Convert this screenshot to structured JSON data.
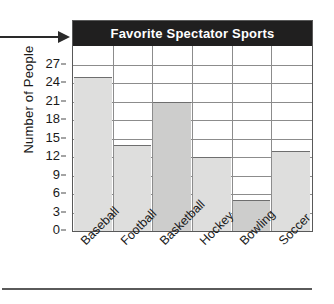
{
  "chart_data": {
    "type": "bar",
    "title": "Favorite Spectator Sports",
    "xlabel": "",
    "ylabel": "Number of People",
    "categories": [
      "Baseball",
      "Football",
      "Basketball",
      "Hockey",
      "Bowling",
      "Soccer"
    ],
    "values": [
      25,
      14,
      21,
      12,
      5,
      13
    ],
    "ylim": [
      0,
      30
    ],
    "yticks": [
      0,
      3,
      6,
      9,
      12,
      15,
      18,
      21,
      24,
      27
    ],
    "ytick_labels": [
      "0",
      "3",
      "6",
      "9",
      "12",
      "15",
      "18",
      "21",
      "24",
      "27"
    ],
    "grid": true,
    "legend": null,
    "bar_colors": [
      "#dededd",
      "#dededd",
      "#cdcdcc",
      "#dededd",
      "#cdcdcc",
      "#dededd"
    ],
    "title_background": "#201f1f",
    "title_color": "#ffffff",
    "gridline_color": "#8c8c8c",
    "frame_color": "#595959"
  },
  "annotations": {
    "pointer_arrow": "arrow-pointing-to-title"
  }
}
